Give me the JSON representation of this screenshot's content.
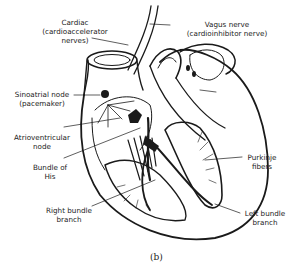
{
  "figure": {
    "caption": "(b)",
    "labels": {
      "cardiac": {
        "line1": "Cardiac",
        "line2": "(cardioaccelerator",
        "line3": "nerves)"
      },
      "vagus": {
        "line1": "Vagus nerve",
        "line2": "(cardioinhibitor nerve)"
      },
      "sa_node": {
        "line1": "Sinoatrial node",
        "line2": "(pacemaker)"
      },
      "av_node": {
        "line1": "Atrioventricular",
        "line2": "node"
      },
      "bundle_his": {
        "line1": "Bundle of",
        "line2": "His"
      },
      "purkinje": {
        "line1": "Purkinje",
        "line2": "fibers"
      },
      "right_bundle": {
        "line1": "Right bundle",
        "line2": "branch"
      },
      "left_bundle": {
        "line1": "Left bundle",
        "line2": "branch"
      }
    },
    "colors": {
      "ink": "#1a1a1a",
      "background": "#ffffff"
    }
  }
}
